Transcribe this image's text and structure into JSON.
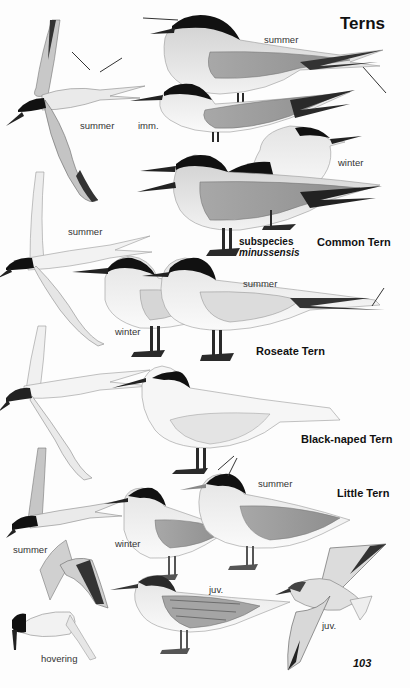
{
  "page": {
    "title": "Terns",
    "page_number": "103"
  },
  "species": [
    {
      "name": "Common Tern",
      "labels": [
        "summer",
        "imm.",
        "winter",
        "summer"
      ],
      "subspecies_label": "subspecies",
      "subspecies_name": "minussensis"
    },
    {
      "name": "Roseate Tern",
      "labels": [
        "summer",
        "winter",
        "summer"
      ]
    },
    {
      "name": "Black-naped Tern",
      "labels": []
    },
    {
      "name": "Little Tern",
      "labels": [
        "summer",
        "summer",
        "winter",
        "juv.",
        "juv.",
        "hovering"
      ]
    }
  ],
  "labels": {
    "common_top_summer": "summer",
    "common_flight_summer": "summer",
    "common_imm": "imm.",
    "common_winter": "winter",
    "roseate_flight_summer": "summer",
    "roseate_summer": "summer",
    "roseate_winter": "winter",
    "little_summer": "summer",
    "little_flight_summer": "summer",
    "little_winter": "winter",
    "little_juv_perched": "juv.",
    "little_juv_flight": "juv.",
    "little_hovering": "hovering"
  },
  "colors": {
    "cap": "#111111",
    "mantle_grey": "#b8b8b8",
    "wing_grey": "#9e9e9e",
    "body_white": "#f4f4f4",
    "legs": "#2a2a2a"
  }
}
